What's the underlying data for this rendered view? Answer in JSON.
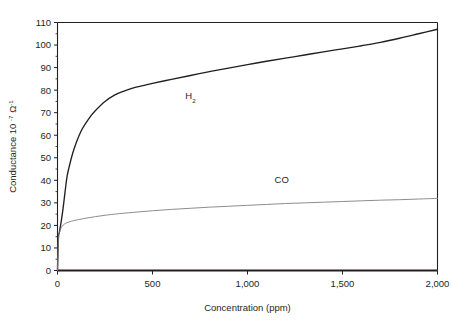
{
  "chart_data": {
    "type": "line",
    "title": "",
    "xlabel": "Concentration (ppm)",
    "ylabel": "Conductance 10",
    "ylabel_exponent": "-7",
    "ylabel_unit": "Ω",
    "ylabel_unit_exponent": "-1",
    "xlim": [
      0,
      2000
    ],
    "ylim": [
      0,
      110
    ],
    "grid": false,
    "legend_position": "inline-annotations",
    "xticks": [
      0,
      500,
      1000,
      1500,
      2000
    ],
    "xtick_labels": [
      "0",
      "500",
      "1,000",
      "1,500",
      "2,000"
    ],
    "yticks": [
      0,
      10,
      20,
      30,
      40,
      50,
      60,
      70,
      80,
      90,
      100,
      110
    ],
    "ytick_labels": [
      "0",
      "10",
      "20",
      "30",
      "40",
      "50",
      "60",
      "70",
      "80",
      "90",
      "100",
      "110"
    ],
    "series": [
      {
        "name": "H2",
        "label": "H",
        "label_subscript": "2",
        "color": "#231f20",
        "line_width": 1.35,
        "annotation_x": 700,
        "annotation_y": 76,
        "x": [
          0,
          5,
          10,
          20,
          30,
          40,
          50,
          60,
          80,
          100,
          125,
          150,
          175,
          200,
          250,
          300,
          350,
          400,
          450,
          500,
          600,
          700,
          800,
          900,
          1000,
          1100,
          1200,
          1300,
          1400,
          1500,
          1600,
          1700,
          1800,
          1900,
          2000
        ],
        "y": [
          0,
          14.5,
          17.0,
          22.0,
          28.0,
          35.0,
          41.5,
          45.5,
          52.0,
          57.0,
          62.0,
          65.5,
          68.5,
          71.0,
          75.0,
          77.8,
          79.6,
          81.0,
          82.0,
          83.0,
          84.8,
          86.5,
          88.2,
          89.8,
          91.3,
          92.8,
          94.2,
          95.6,
          97.0,
          98.3,
          99.7,
          101.2,
          103.0,
          105.0,
          107.0
        ]
      },
      {
        "name": "CO",
        "label": "CO",
        "color": "#808080",
        "line_width": 0.9,
        "annotation_x": 1180,
        "annotation_y": 39,
        "x": [
          0,
          5,
          10,
          20,
          30,
          40,
          50,
          75,
          100,
          150,
          200,
          250,
          300,
          400,
          500,
          600,
          700,
          800,
          900,
          1000,
          1100,
          1200,
          1300,
          1400,
          1500,
          1600,
          1700,
          1800,
          1900,
          2000
        ],
        "y": [
          0,
          14.0,
          16.8,
          19.0,
          20.2,
          20.8,
          21.2,
          21.9,
          22.4,
          23.2,
          23.9,
          24.5,
          25.0,
          25.8,
          26.5,
          27.1,
          27.6,
          28.1,
          28.5,
          28.9,
          29.3,
          29.7,
          30.0,
          30.3,
          30.6,
          30.9,
          31.2,
          31.4,
          31.7,
          32.0
        ]
      }
    ]
  }
}
